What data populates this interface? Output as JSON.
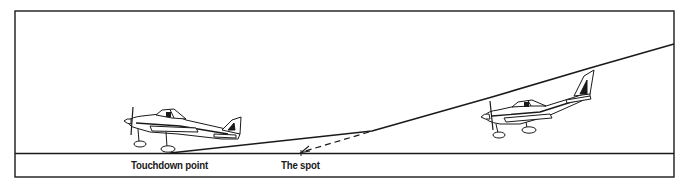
{
  "diagram": {
    "type": "landing-approach-illustration",
    "labels": {
      "touchdown": "Touchdown point",
      "spot": "The spot"
    },
    "elements": {
      "ground_line": "runway surface",
      "flight_path": "approach and flare path",
      "aim_line": "dashed line from flare start to the spot",
      "aircraft": [
        "airplane on approach",
        "airplane at touchdown"
      ]
    },
    "colors": {
      "ink": "#1a1a1a",
      "background": "#ffffff"
    }
  }
}
